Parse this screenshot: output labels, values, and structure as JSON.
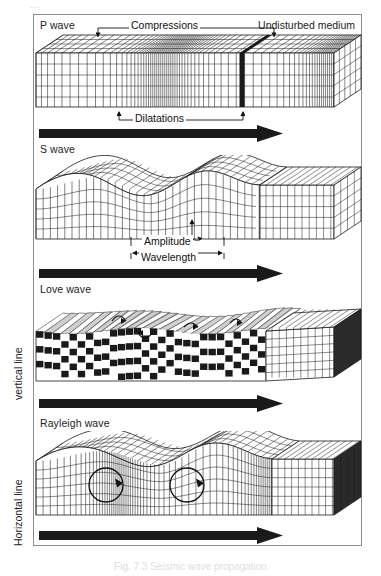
{
  "figure": {
    "top_cut_text": "...",
    "caption": "Fig. 7.3 Seismic wave propagation",
    "border_color": "#8d8d8d",
    "ink_color": "#1a1a1a"
  },
  "side_labels": {
    "vertical": "vertical line",
    "horizontal": "Horizontal line"
  },
  "panels": [
    {
      "id": "p-wave",
      "label": "P wave",
      "right_label": "Undisturbed medium",
      "callouts": [
        {
          "name": "compressions",
          "text": "Compressions"
        },
        {
          "name": "dilatations",
          "text": "Dilatations"
        }
      ],
      "arrow": {
        "name": "propagation-direction-arrow"
      }
    },
    {
      "id": "s-wave",
      "label": "S wave",
      "right_label": "",
      "callouts": [
        {
          "name": "amplitude",
          "text": "Amplitude"
        },
        {
          "name": "wavelength",
          "text": "Wavelength"
        }
      ],
      "arrow": {
        "name": "propagation-direction-arrow"
      }
    },
    {
      "id": "love-wave",
      "label": "Love wave",
      "right_label": "",
      "callouts": [],
      "arrow": {
        "name": "propagation-direction-arrow"
      }
    },
    {
      "id": "rayleigh-wave",
      "label": "Rayleigh wave",
      "right_label": "",
      "callouts": [],
      "arrow": {
        "name": "propagation-direction-arrow"
      }
    }
  ]
}
